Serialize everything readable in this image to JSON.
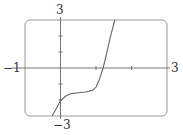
{
  "chart_data": {
    "type": "line",
    "title": "",
    "xlabel": "",
    "ylabel": "",
    "xlim": [
      -1,
      3
    ],
    "ylim": [
      -3,
      3
    ],
    "grid": false,
    "tick_labels": {
      "x_min": "−1",
      "x_max": "3",
      "y_max": "3",
      "y_min": "−3"
    },
    "x_ticks": [
      1,
      2
    ],
    "y_ticks": [
      -2,
      -1,
      1,
      2
    ],
    "series": [
      {
        "name": "f(x)",
        "x": [
          -0.24,
          -0.12,
          0,
          0.15,
          0.3,
          0.5,
          0.7,
          0.9,
          1.0,
          1.1,
          1.2,
          1.3,
          1.4,
          1.53
        ],
        "y": [
          -3,
          -2.55,
          -2.05,
          -1.75,
          -1.6,
          -1.55,
          -1.5,
          -1.4,
          -1.2,
          -0.7,
          0,
          0.9,
          1.9,
          3
        ]
      }
    ],
    "colors": {
      "curve": "#666666",
      "frame": "#999999",
      "axes": "#555555"
    }
  }
}
